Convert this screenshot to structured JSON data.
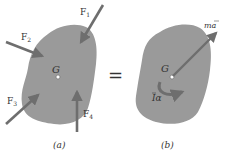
{
  "figure": {
    "panels": [
      {
        "id": "a",
        "caption": "(a)",
        "center_label": "G",
        "forces": [
          {
            "label": "F",
            "sub": "1"
          },
          {
            "label": "F",
            "sub": "2"
          },
          {
            "label": "F",
            "sub": "3"
          },
          {
            "label": "F",
            "sub": "4"
          }
        ]
      },
      {
        "id": "b",
        "caption": "(b)",
        "center_label": "G",
        "linear_label": "ma",
        "angular_label": "Iα"
      }
    ],
    "equals_sign": "=",
    "colors": {
      "body_fill": "#9a9a9a",
      "arrow": "#6e6e6e",
      "text": "#333333",
      "background": "#ffffff"
    }
  }
}
